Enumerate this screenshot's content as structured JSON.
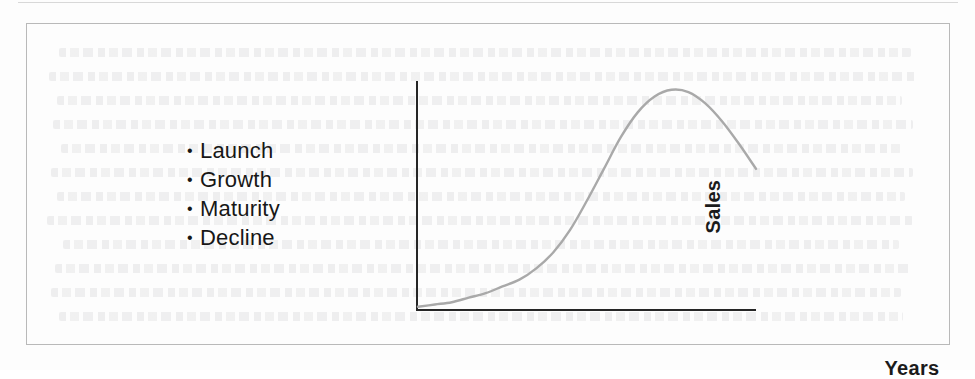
{
  "figure": {
    "stages_title": "Product Life Cycle Stages",
    "stages": [
      {
        "bullet": "•",
        "label": "Launch"
      },
      {
        "bullet": "•",
        "label": "Growth"
      },
      {
        "bullet": "•",
        "label": "Maturity"
      },
      {
        "bullet": "•",
        "label": "Decline"
      }
    ],
    "colors": {
      "curve": "#a9a9a9",
      "axis": "#262626",
      "frame": "#b9b9b9",
      "text": "#171717",
      "background": "#fdfdfd"
    }
  },
  "chart_data": {
    "type": "line",
    "title": "",
    "xlabel": "Years",
    "ylabel": "Sales",
    "grid": false,
    "legend": false,
    "xlim": [
      0,
      100
    ],
    "ylim": [
      0,
      100
    ],
    "series": [
      {
        "name": "Sales",
        "color": "#a9a9a9",
        "x": [
          0,
          5,
          10,
          15,
          20,
          25,
          30,
          35,
          40,
          45,
          50,
          55,
          60,
          65,
          70,
          75,
          80,
          85,
          90,
          95,
          100
        ],
        "y": [
          1,
          2,
          3,
          5,
          7,
          10,
          13,
          18,
          25,
          35,
          48,
          62,
          76,
          87,
          94,
          97,
          96,
          91,
          83,
          73,
          62
        ]
      }
    ],
    "annotations": [
      {
        "text": "Launch",
        "stage": 1
      },
      {
        "text": "Growth",
        "stage": 2
      },
      {
        "text": "Maturity",
        "stage": 3
      },
      {
        "text": "Decline",
        "stage": 4
      }
    ]
  }
}
